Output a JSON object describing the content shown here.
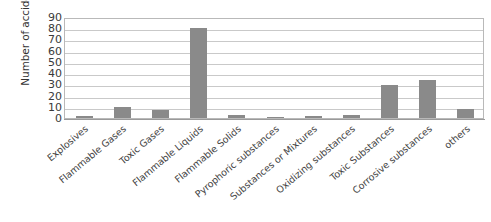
{
  "chart_data": {
    "type": "bar",
    "title": "",
    "xlabel": "",
    "ylabel": "Number of accidents",
    "ylim": [
      0,
      90
    ],
    "ytick_step": 10,
    "yticks": [
      90,
      80,
      70,
      60,
      50,
      40,
      30,
      20,
      10,
      0
    ],
    "grid": true,
    "legend": "none",
    "bar_color": "#8a8a8a",
    "plot_border_color": "#b9b9b9",
    "gridline_color": "#c9c9c9",
    "categories": [
      "Explosives",
      "Flammable Gases",
      "Toxic Gases",
      "Flammable Liquids",
      "Flammable Solids",
      "Pyrophoric substances",
      "Substances or Mixtures",
      "Oxidizing substances",
      "Toxic Substances",
      "Corrosive substances",
      "others"
    ],
    "values": [
      2,
      10,
      7,
      80,
      3,
      1,
      2,
      3,
      29,
      34,
      8
    ],
    "series": [
      {
        "name": "Number of accidents",
        "values": [
          2,
          10,
          7,
          80,
          3,
          1,
          2,
          3,
          29,
          34,
          8
        ]
      }
    ]
  }
}
